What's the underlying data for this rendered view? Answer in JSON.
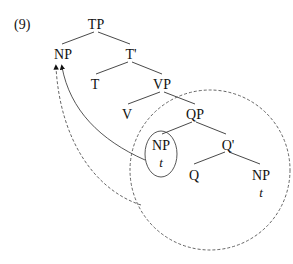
{
  "example_number": "(9)",
  "nodes": {
    "tp": "TP",
    "np_spec": "NP",
    "t_bar": "T'",
    "t_head": "T",
    "vp": "VP",
    "v": "V",
    "qp": "QP",
    "np_inner": "NP",
    "np_inner_trace": "t",
    "q_bar": "Q'",
    "q_head": "Q",
    "np_comp": "NP",
    "np_comp_trace": "t"
  },
  "edges": [
    [
      "tp",
      "np_spec"
    ],
    [
      "tp",
      "t_bar"
    ],
    [
      "t_bar",
      "t_head"
    ],
    [
      "t_bar",
      "vp"
    ],
    [
      "vp",
      "v"
    ],
    [
      "vp",
      "qp"
    ],
    [
      "qp",
      "np_inner"
    ],
    [
      "qp",
      "q_bar"
    ],
    [
      "q_bar",
      "q_head"
    ],
    [
      "q_bar",
      "np_comp"
    ]
  ],
  "movements": [
    {
      "from": "np_inner (circled)",
      "to": "np_spec",
      "style": "solid"
    },
    {
      "from": "qp (dashed circle)",
      "to": "np_spec",
      "style": "dashed"
    }
  ]
}
